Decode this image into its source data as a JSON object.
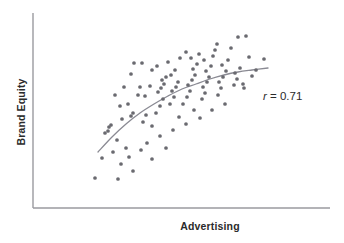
{
  "figure": {
    "background": "#ffffff",
    "point_color": "#6a6a70",
    "line_color": "#8a8a93",
    "axis_color": "#9a9a9f",
    "text_color": "#2b2b2b"
  },
  "axes": {
    "x_label": "Advertising",
    "y_label": "Brand Equity",
    "x_axis": {
      "x1": 33,
      "y1": 208,
      "x2": 330,
      "y2": 208
    },
    "y_axis": {
      "x1": 33,
      "y1": 13,
      "x2": 33,
      "y2": 208
    }
  },
  "annotation": {
    "symbol": "r",
    "equals": " = ",
    "value": "0.71",
    "full_text": "r = 0.71"
  },
  "chart_data": {
    "type": "scatter",
    "title": "",
    "xlabel": "Advertising",
    "ylabel": "Brand Equity",
    "grid": false,
    "legend": null,
    "xlim": [
      0,
      100
    ],
    "ylim": [
      0,
      100
    ],
    "correlation": 0.71,
    "annotations": [
      {
        "text": "r = 0.71",
        "x": 263,
        "y": 90
      }
    ],
    "trend_line": {
      "kind": "smoothed-fit",
      "color": "#8a8a93",
      "width": 1.3,
      "points_px": [
        [
          98,
          152
        ],
        [
          112,
          137
        ],
        [
          126,
          124
        ],
        [
          140,
          113
        ],
        [
          154,
          104
        ],
        [
          168,
          96
        ],
        [
          182,
          89
        ],
        [
          196,
          84
        ],
        [
          210,
          79
        ],
        [
          224,
          75
        ],
        [
          238,
          72
        ],
        [
          252,
          70
        ],
        [
          268,
          68
        ]
      ]
    },
    "points_px": [
      [
        95,
        178
      ],
      [
        118,
        179
      ],
      [
        121,
        164
      ],
      [
        133,
        171
      ],
      [
        102,
        158
      ],
      [
        113,
        152
      ],
      [
        126,
        148
      ],
      [
        117,
        140
      ],
      [
        105,
        133
      ],
      [
        108,
        131
      ],
      [
        109,
        127
      ],
      [
        111,
        125
      ],
      [
        122,
        119
      ],
      [
        131,
        116
      ],
      [
        133,
        113
      ],
      [
        120,
        106
      ],
      [
        128,
        104
      ],
      [
        143,
        122
      ],
      [
        146,
        115
      ],
      [
        152,
        126
      ],
      [
        138,
        95
      ],
      [
        145,
        96
      ],
      [
        140,
        87
      ],
      [
        150,
        86
      ],
      [
        131,
        74
      ],
      [
        142,
        63
      ],
      [
        156,
        113
      ],
      [
        160,
        106
      ],
      [
        163,
        99
      ],
      [
        158,
        92
      ],
      [
        161,
        88
      ],
      [
        164,
        84
      ],
      [
        162,
        80
      ],
      [
        166,
        77
      ],
      [
        152,
        70
      ],
      [
        157,
        66
      ],
      [
        170,
        104
      ],
      [
        174,
        97
      ],
      [
        172,
        91
      ],
      [
        176,
        87
      ],
      [
        178,
        82
      ],
      [
        171,
        75
      ],
      [
        175,
        70
      ],
      [
        168,
        62
      ],
      [
        180,
        58
      ],
      [
        186,
        52
      ],
      [
        183,
        104
      ],
      [
        187,
        97
      ],
      [
        190,
        91
      ],
      [
        188,
        85
      ],
      [
        192,
        80
      ],
      [
        195,
        75
      ],
      [
        193,
        69
      ],
      [
        197,
        64
      ],
      [
        191,
        58
      ],
      [
        199,
        54
      ],
      [
        202,
        99
      ],
      [
        205,
        93
      ],
      [
        203,
        87
      ],
      [
        207,
        82
      ],
      [
        209,
        77
      ],
      [
        206,
        71
      ],
      [
        211,
        66
      ],
      [
        204,
        60
      ],
      [
        213,
        56
      ],
      [
        215,
        50
      ],
      [
        218,
        95
      ],
      [
        221,
        88
      ],
      [
        219,
        82
      ],
      [
        223,
        77
      ],
      [
        226,
        71
      ],
      [
        222,
        65
      ],
      [
        228,
        60
      ],
      [
        231,
        48
      ],
      [
        217,
        44
      ],
      [
        234,
        85
      ],
      [
        237,
        79
      ],
      [
        235,
        73
      ],
      [
        240,
        68
      ],
      [
        243,
        84
      ],
      [
        244,
        88
      ],
      [
        238,
        37
      ],
      [
        246,
        36
      ],
      [
        249,
        57
      ],
      [
        252,
        76
      ],
      [
        256,
        70
      ],
      [
        264,
        59
      ],
      [
        200,
        118
      ],
      [
        212,
        110
      ],
      [
        225,
        104
      ],
      [
        186,
        124
      ],
      [
        173,
        130
      ],
      [
        160,
        136
      ],
      [
        147,
        143
      ],
      [
        141,
        150
      ],
      [
        129,
        157
      ],
      [
        152,
        159
      ],
      [
        166,
        148
      ],
      [
        179,
        117
      ],
      [
        194,
        110
      ],
      [
        134,
        63
      ],
      [
        124,
        87
      ],
      [
        115,
        95
      ]
    ]
  }
}
